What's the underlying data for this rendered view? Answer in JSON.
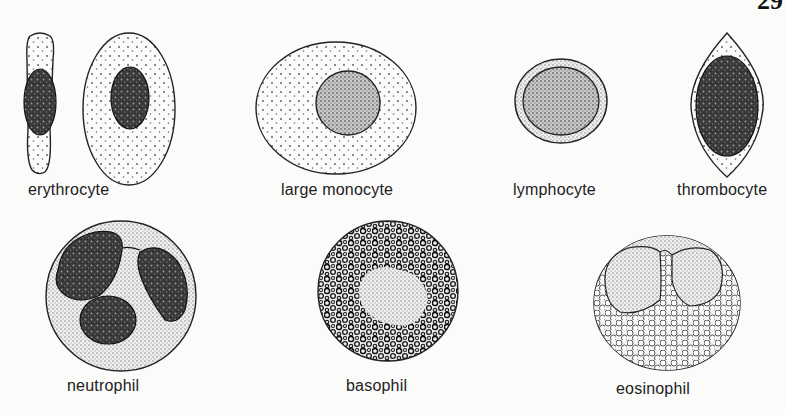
{
  "page": {
    "number": "29"
  },
  "figure": {
    "cells": [
      {
        "id": "erythrocyte",
        "label": "erythrocyte",
        "views": [
          "side view",
          "face view"
        ]
      },
      {
        "id": "large-monocyte",
        "label": "large monocyte"
      },
      {
        "id": "lymphocyte",
        "label": "lymphocyte"
      },
      {
        "id": "thrombocyte",
        "label": "thrombocyte"
      },
      {
        "id": "neutrophil",
        "label": "neutrophil"
      },
      {
        "id": "basophil",
        "label": "basophil"
      },
      {
        "id": "eosinophil",
        "label": "eosinophil"
      }
    ]
  },
  "colors": {
    "ink": "#1a1a1a",
    "paper": "#fbfbfa",
    "nucleus": "#2b2b2b"
  }
}
